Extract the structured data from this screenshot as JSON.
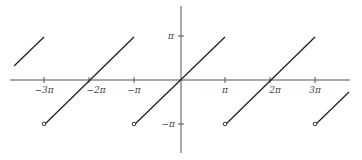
{
  "diagram": {
    "x_ticks": [
      {
        "label": "−3π",
        "x": 44
      },
      {
        "label": "−2π",
        "x": 89
      },
      {
        "label": "−π",
        "x": 134
      },
      {
        "label": "π",
        "x": 225
      },
      {
        "label": "2π",
        "x": 270
      },
      {
        "label": "3π",
        "x": 315
      }
    ],
    "y_ticks": [
      {
        "label": "π",
        "y": 36
      },
      {
        "label": "−π",
        "y": 124
      }
    ],
    "colors": {
      "line": "#222222",
      "axis": "#555555",
      "text": "#444444"
    }
  }
}
